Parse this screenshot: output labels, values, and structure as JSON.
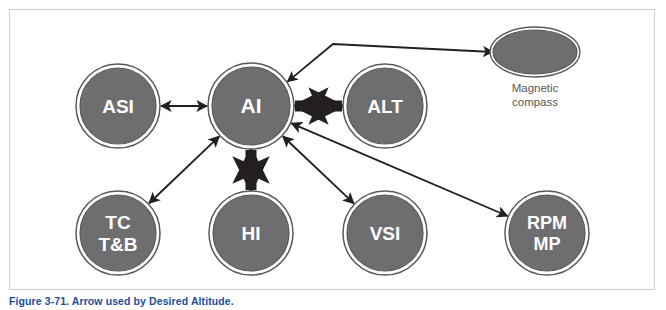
{
  "figure": {
    "caption_number": "Figure 3-71.",
    "caption_text": "Arrow used by Desired Altitude.",
    "caption_color": "#1b4f9c",
    "panel_border_color": "#c9cbcd",
    "background_color": "#ffffff"
  },
  "style": {
    "node_fill": "#6e6e70",
    "node_inner_ring": "#ffffff",
    "node_outer_ring": "#58595b",
    "node_text_color": "#ffffff",
    "arrow_color": "#231f20",
    "external_label_color": "#58595b"
  },
  "nodes": [
    {
      "id": "asi",
      "label": "ASI",
      "lines": [
        "ASI"
      ],
      "cx": 118,
      "cy": 106,
      "r": 38,
      "shape": "circle",
      "font_size": 19
    },
    {
      "id": "ai",
      "label": "AI",
      "lines": [
        "AI"
      ],
      "cx": 251,
      "cy": 106,
      "r": 39,
      "shape": "circle",
      "font_size": 21
    },
    {
      "id": "alt",
      "label": "ALT",
      "lines": [
        "ALT"
      ],
      "cx": 385,
      "cy": 106,
      "r": 38,
      "shape": "circle",
      "font_size": 19
    },
    {
      "id": "tctb",
      "label": "TC T&B",
      "lines": [
        "TC",
        "T&B"
      ],
      "cx": 118,
      "cy": 233,
      "r": 38,
      "shape": "circle",
      "font_size": 19
    },
    {
      "id": "hi",
      "label": "HI",
      "lines": [
        "HI"
      ],
      "cx": 251,
      "cy": 233,
      "r": 38,
      "shape": "circle",
      "font_size": 19
    },
    {
      "id": "vsi",
      "label": "VSI",
      "lines": [
        "VSI"
      ],
      "cx": 385,
      "cy": 233,
      "r": 38,
      "shape": "circle",
      "font_size": 19
    },
    {
      "id": "rpmmp",
      "label": "RPM MP",
      "lines": [
        "RPM",
        "MP"
      ],
      "cx": 547,
      "cy": 233,
      "r": 38,
      "shape": "circle",
      "font_size": 18
    }
  ],
  "external_nodes": [
    {
      "id": "magnetic-compass",
      "label_lines": [
        "Magnetic",
        "compass"
      ],
      "cx": 535,
      "cy": 52,
      "rx": 42,
      "ry": 22,
      "shape": "ellipse",
      "label_x": 535,
      "label_y": 92
    }
  ],
  "connections": [
    {
      "id": "asi-ai",
      "from": "asi",
      "to": "ai",
      "style": "thin-double",
      "description": "ASI double arrow AI"
    },
    {
      "id": "ai-alt",
      "from": "ai",
      "to": "alt",
      "style": "thick-double",
      "description": "AI thick double arrow ALT"
    },
    {
      "id": "ai-hi",
      "from": "ai",
      "to": "hi",
      "style": "thick-double",
      "description": "AI thick double arrow HI"
    },
    {
      "id": "ai-tctb",
      "from": "ai",
      "to": "tctb",
      "style": "thin-double",
      "description": "AI double arrow TC T&B"
    },
    {
      "id": "ai-vsi",
      "from": "ai",
      "to": "vsi",
      "style": "thin-double",
      "description": "AI double arrow VSI"
    },
    {
      "id": "ai-rpmmp",
      "from": "ai",
      "to": "rpmmp",
      "style": "thin-double",
      "description": "AI double arrow RPM MP"
    },
    {
      "id": "compass-ai",
      "from": "magnetic-compass",
      "to": "ai",
      "style": "thin-elbow-double",
      "description": "Magnetic compass elbow double arrow AI"
    }
  ]
}
